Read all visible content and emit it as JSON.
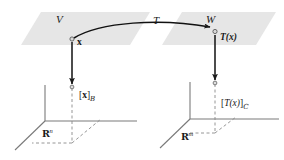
{
  "figure": {
    "background_color": "#ffffff",
    "plane_fill": "#e8e8e8",
    "line_color": "#6f6f6f",
    "arrow_color": "#1a1a1a",
    "text_color": "#1a1a1a"
  },
  "planes": {
    "domain": {
      "label": "V",
      "name": "domain-plane"
    },
    "codomain": {
      "label": "W",
      "name": "codomain-plane"
    }
  },
  "map": {
    "label": "T",
    "name": "transformation-arrow"
  },
  "points": {
    "x": {
      "label": "x",
      "name": "vector-x"
    },
    "Tx": {
      "label": "T(x)",
      "name": "vector-t-of-x"
    }
  },
  "coordinates": {
    "left": {
      "bracket_open": "[",
      "vector": "x",
      "bracket_close": "]",
      "basis": "B",
      "space_symbol": "R",
      "space_exponent": "n"
    },
    "right": {
      "bracket_open": "[",
      "vector": "T(x)",
      "bracket_close": "]",
      "basis": "C",
      "space_symbol": "R",
      "space_exponent": "m"
    }
  },
  "vertical_arrows": {
    "left": {
      "name": "coordinate-map-left"
    },
    "right": {
      "name": "coordinate-map-right"
    }
  }
}
